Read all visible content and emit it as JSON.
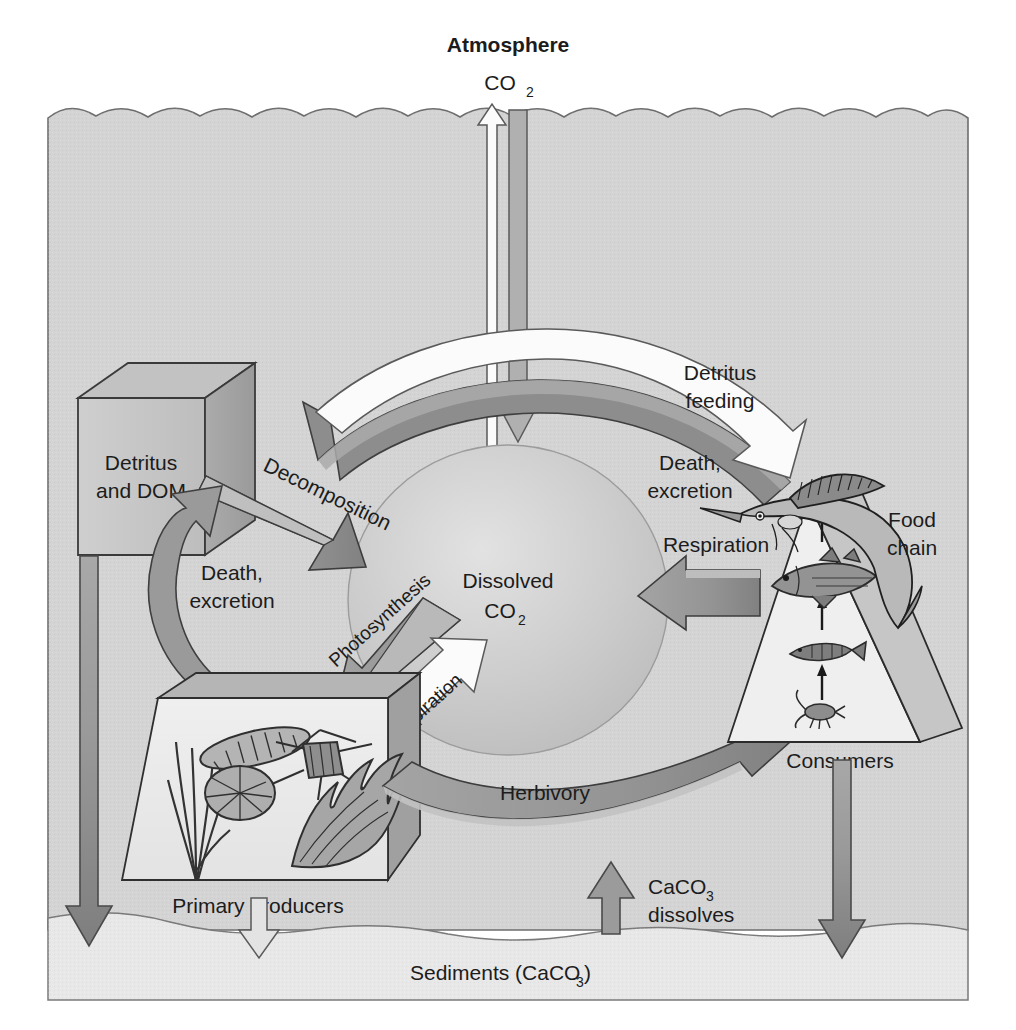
{
  "figure": {
    "title_top": "Atmosphere",
    "background_color": "#ffffff",
    "water_color": "#d4d4d4",
    "sediment_color": "#e6e6e6",
    "sphere_color": "#c9c9c9",
    "arrow_gray": "#8f8f8f",
    "arrow_white": "#fdfdfd",
    "outline_color": "#4a4a4a",
    "text_color": "#1c1c1c"
  },
  "labels": {
    "atmosphere": "Atmosphere",
    "co2_air": "CO",
    "co2_air_sub": "2",
    "dissolved_line1": "Dissolved",
    "dissolved_line2": "CO",
    "dissolved_sub": "2",
    "detritus_line1": "Detritus",
    "detritus_line2": "and DOM",
    "primary_producers": "Primary producers",
    "consumers": "Consumers",
    "food_chain_line1": "Food",
    "food_chain_line2": "chain",
    "sediments": "Sediments (CaCO",
    "sediments_sub": "3",
    "sediments_tail": ")",
    "caco3_line1": "CaCO",
    "caco3_sub": "3",
    "caco3_line2": "dissolves"
  },
  "flows": [
    {
      "id": "co2-outgassing",
      "label": "",
      "style": "white-outline",
      "direction": "up",
      "from": "Dissolved CO2",
      "to": "Atmosphere"
    },
    {
      "id": "co2-dissolution",
      "label": "",
      "style": "gray-fill",
      "direction": "down",
      "from": "Atmosphere",
      "to": "Dissolved CO2"
    },
    {
      "id": "decomposition",
      "label": "Decomposition",
      "style": "gray-fill",
      "direction": "down-right",
      "from": "Detritus and DOM",
      "to": "Dissolved CO2"
    },
    {
      "id": "death-excretion-top",
      "label": "Death,\nexcretion",
      "label_line1": "Death,",
      "label_line2": "excretion",
      "style": "gray-fill",
      "direction": "curve-left",
      "from": "Consumers",
      "to": "Detritus and DOM"
    },
    {
      "id": "detritus-feeding",
      "label": "Detritus\nfeeding",
      "label_line1": "Detritus",
      "label_line2": "feeding",
      "style": "white-outline",
      "direction": "curve-right",
      "from": "Detritus and DOM",
      "to": "Consumers"
    },
    {
      "id": "death-excretion-left",
      "label": "Death,\nexcretion",
      "label_line1": "Death,",
      "label_line2": "excretion",
      "style": "gray-fill",
      "direction": "curve-up",
      "from": "Primary producers",
      "to": "Detritus and DOM"
    },
    {
      "id": "photosynthesis",
      "label": "Photosynthesis",
      "style": "gray-fill",
      "direction": "down-left",
      "from": "Dissolved CO2",
      "to": "Primary producers"
    },
    {
      "id": "respiration-producers",
      "label": "Respiration",
      "style": "white-outline",
      "direction": "up-right",
      "from": "Primary producers",
      "to": "Dissolved CO2"
    },
    {
      "id": "respiration-consumers",
      "label": "Respiration",
      "style": "gray-fill",
      "direction": "left",
      "from": "Consumers",
      "to": "Dissolved CO2"
    },
    {
      "id": "herbivory",
      "label": "Herbivory",
      "style": "gray-fill",
      "direction": "curve-right-up",
      "from": "Primary producers",
      "to": "Consumers"
    },
    {
      "id": "caco3-dissolves",
      "label": "CaCO3 dissolves",
      "style": "gray-fill",
      "direction": "up",
      "from": "Sediments",
      "to": "Water column"
    },
    {
      "id": "detritus-sinking",
      "label": "",
      "style": "gray-fill",
      "direction": "down",
      "from": "Detritus and DOM",
      "to": "Sediments"
    },
    {
      "id": "producers-sinking",
      "label": "",
      "style": "white-outline",
      "direction": "down",
      "from": "Primary producers",
      "to": "Sediments"
    },
    {
      "id": "consumers-sinking",
      "label": "",
      "style": "gray-fill",
      "direction": "down",
      "from": "Consumers",
      "to": "Sediments"
    }
  ],
  "food_chain_levels": [
    {
      "name": "zooplankton-copepod",
      "rank": 1
    },
    {
      "name": "small-fish",
      "rank": 2
    },
    {
      "name": "medium-fish",
      "rank": 3
    },
    {
      "name": "sailfish",
      "rank": 4
    }
  ],
  "primary_producer_organisms": [
    {
      "name": "filamentous-algae"
    },
    {
      "name": "pennate-diatom"
    },
    {
      "name": "centric-diatom"
    },
    {
      "name": "star-diatom"
    },
    {
      "name": "kelp-blade"
    }
  ]
}
